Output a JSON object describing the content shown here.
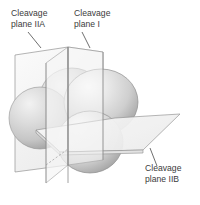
{
  "figure": {
    "name": "cleavage-planes-diagram",
    "background_color": "#ffffff",
    "text_color": "#3b3b3b",
    "plane_fill": "#f4f4f4",
    "plane_stroke": "#8c8c8c",
    "sphere_stroke": "#8a8a8a",
    "sphere_light": "#fbfbfb",
    "sphere_mid": "#d8d8d8",
    "sphere_dark": "#a9a9a9"
  },
  "labels": [
    {
      "id": "label-plane-iia",
      "name": "label-cleavage-plane-iia",
      "line1": "Cleavage",
      "line2": "plane IIA",
      "x": 11,
      "y1": 16,
      "y2": 27,
      "leader": {
        "x1": 28,
        "y1": 32,
        "x2": 41,
        "y2": 48
      }
    },
    {
      "id": "label-plane-i",
      "name": "label-cleavage-plane-i",
      "line1": "Cleavage",
      "line2": "plane I",
      "x": 74,
      "y1": 16,
      "y2": 27,
      "leader": {
        "x1": 82,
        "y1": 32,
        "x2": 90,
        "y2": 48
      }
    },
    {
      "id": "label-plane-iib",
      "name": "label-cleavage-plane-iib",
      "line1": "Cleavage",
      "line2": "plane IIB",
      "x": 145,
      "y1": 171,
      "y2": 182,
      "leader": {
        "x1": 157,
        "y1": 166,
        "x2": 150,
        "y2": 148
      }
    }
  ],
  "spheres": [
    {
      "id": "sphere-back-top",
      "name": "sphere-back-top",
      "cx": 72,
      "cy": 100,
      "rx": 33,
      "ry": 32,
      "order": 1
    },
    {
      "id": "sphere-left",
      "name": "sphere-left",
      "cx": 40,
      "cy": 118,
      "rx": 31,
      "ry": 31,
      "order": 2
    },
    {
      "id": "sphere-right-main",
      "name": "sphere-right-main",
      "cx": 100,
      "cy": 102,
      "rx": 37,
      "ry": 33,
      "order": 3
    },
    {
      "id": "sphere-front-bottom",
      "name": "sphere-front-bottom",
      "cx": 90,
      "cy": 142,
      "rx": 33,
      "ry": 31,
      "order": 4
    }
  ],
  "planes": [
    {
      "id": "plane-iia",
      "name": "plane-iia-vertical-left",
      "orientation": "vertical"
    },
    {
      "id": "plane-i",
      "name": "plane-i-vertical-right",
      "orientation": "vertical"
    },
    {
      "id": "plane-iib",
      "name": "plane-iib-horizontal",
      "orientation": "horizontal"
    }
  ]
}
